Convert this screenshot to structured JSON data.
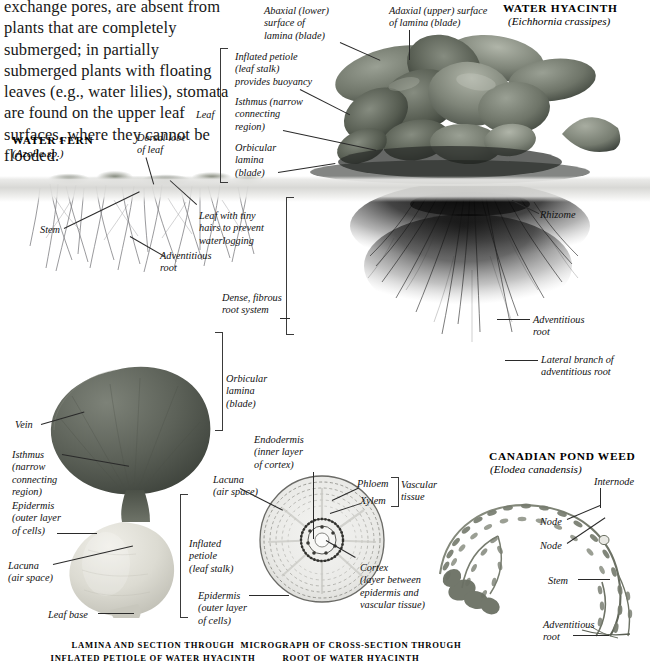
{
  "page": {
    "body_text": "exchange pores, are absent from plants that are completely submerged; in partially submerged plants with floating leaves (e.g., water lilies), stomata are found on the upper leaf surfaces, where they cannot be flooded."
  },
  "sections": {
    "water_fern": {
      "title": "WATER FERN",
      "binomial": "(Azolla sp.)",
      "labels": [
        {
          "id": "dorsal-lobe",
          "text": "Dorsal lobe\nof leaf"
        },
        {
          "id": "stem",
          "text": "Stem"
        },
        {
          "id": "adventitious-root",
          "text": "Adventitious\nroot"
        },
        {
          "id": "leaf-hairs",
          "text": "Leaf with tiny\nhairs to prevent\nwaterlogging"
        }
      ]
    },
    "water_hyacinth": {
      "title": "WATER HYACINTH",
      "binomial": "(Eichhornia crassipes)",
      "labels": [
        {
          "id": "abaxial",
          "text": "Abaxial (lower)\nsurface of\nlamina (blade)"
        },
        {
          "id": "adaxial",
          "text": "Adaxial (upper) surface\nof lamina (blade)"
        },
        {
          "id": "inflated-petiole",
          "text": "Inflated petiole\n(leaf stalk)\nprovides buoyancy"
        },
        {
          "id": "isthmus",
          "text": "Isthmus (narrow\nconnecting\nregion)"
        },
        {
          "id": "orbicular-lamina",
          "text": "Orbicular\nlamina\n(blade)"
        },
        {
          "id": "leaf-bracket",
          "text": "Leaf"
        },
        {
          "id": "rhizome",
          "text": "Rhizome"
        },
        {
          "id": "dense-fibrous",
          "text": "Dense, fibrous\nroot system"
        },
        {
          "id": "adventitious-root",
          "text": "Adventitious\nroot"
        },
        {
          "id": "lateral-branch",
          "text": "Lateral branch of\nadventitious root"
        }
      ]
    },
    "lamina_plate": {
      "caption": "LAMINA AND SECTION THROUGH INFLATED\nPETIOLE OF WATER HYACINTH",
      "labels": [
        {
          "id": "orbicular-lamina",
          "text": "Orbicular\nlamina\n(blade)"
        },
        {
          "id": "vein",
          "text": "Vein"
        },
        {
          "id": "isthmus",
          "text": "Isthmus\n(narrow\nconnecting\nregion)"
        },
        {
          "id": "epidermis",
          "text": "Epidermis\n(outer layer\nof cells)"
        },
        {
          "id": "lacuna",
          "text": "Lacuna\n(air space)"
        },
        {
          "id": "leaf-base",
          "text": "Leaf base"
        },
        {
          "id": "inflated-petiole",
          "text": "Inflated\npetiole\n(leaf stalk)"
        }
      ]
    },
    "micrograph": {
      "caption": "MICROGRAPH OF CROSS-SECTION\nTHROUGH ROOT OF WATER HYACINTH",
      "labels": [
        {
          "id": "endodermis",
          "text": "Endodermis\n(inner layer\nof cortex)"
        },
        {
          "id": "lacuna",
          "text": "Lacuna\n(air space)"
        },
        {
          "id": "phloem",
          "text": "Phloem"
        },
        {
          "id": "xylem",
          "text": "Xylem"
        },
        {
          "id": "vascular-tissue",
          "text": "Vascular\ntissue"
        },
        {
          "id": "cortex",
          "text": "Cortex\n(layer between\nepidermis and\nvascular tissue)"
        },
        {
          "id": "epidermis",
          "text": "Epidermis\n(outer layer\nof cells)"
        }
      ]
    },
    "pond_weed": {
      "title": "CANADIAN POND WEED",
      "binomial": "(Elodea canadensis)",
      "labels": [
        {
          "id": "internode",
          "text": "Internode"
        },
        {
          "id": "node-1",
          "text": "Node"
        },
        {
          "id": "node-2",
          "text": "Node"
        },
        {
          "id": "stem",
          "text": "Stem"
        },
        {
          "id": "adventitious-root",
          "text": "Adventitious\nroot"
        }
      ]
    }
  },
  "colors": {
    "paper": "#ffffff",
    "ink": "#111111",
    "leader": "#2a2a2a",
    "water": "#d6d6d3"
  }
}
